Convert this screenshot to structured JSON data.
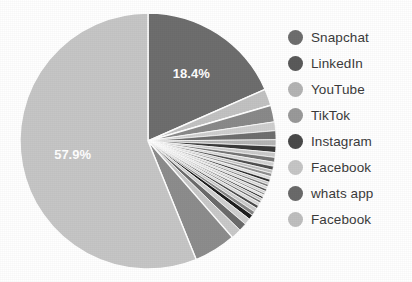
{
  "chart_data": {
    "type": "pie",
    "title": "",
    "xlabel": "",
    "ylabel": "",
    "legend_position": "right",
    "grid": false,
    "start_angle_deg": 90,
    "direction": "clockwise",
    "separator_color": "#ffffff",
    "visible_labels": [
      {
        "text": "18.4%",
        "value": 18.4
      },
      {
        "text": "57.9%",
        "value": 57.9
      }
    ],
    "categories": [
      "Snapchat",
      "LinkedIn",
      "YouTube",
      "TikTok",
      "Instagram",
      "Facebook",
      "whats app",
      "Facebook"
    ],
    "values": [
      18.4,
      2.6,
      7.9,
      1.3,
      1.3,
      57.9,
      5.3,
      5.3
    ],
    "colors": [
      "#6e6e6e",
      "#5a5a5a",
      "#b4b4b4",
      "#9a9a9a",
      "#4a4a4a",
      "#c6c6c6",
      "#6a6a6a",
      "#bfbfbf"
    ],
    "slices": [
      {
        "label": "18.4%",
        "value": 18.4,
        "color": "#6e6e6e",
        "start_deg": 0.0,
        "sweep_deg": 66.2
      },
      {
        "value": 2.1,
        "color": "#c2c2c2",
        "start_deg": 66.2,
        "sweep_deg": 7.6
      },
      {
        "value": 2.1,
        "color": "#8a8a8a",
        "start_deg": 73.8,
        "sweep_deg": 7.6
      },
      {
        "value": 1.1,
        "color": "#cfcfcf",
        "start_deg": 81.4,
        "sweep_deg": 4.0
      },
      {
        "value": 1.1,
        "color": "#6f6f6f",
        "start_deg": 85.4,
        "sweep_deg": 4.0
      },
      {
        "value": 0.8,
        "color": "#b5b5b5",
        "start_deg": 89.4,
        "sweep_deg": 2.9
      },
      {
        "value": 0.8,
        "color": "#3a3a3a",
        "start_deg": 92.3,
        "sweep_deg": 2.9
      },
      {
        "value": 0.6,
        "color": "#cacaca",
        "start_deg": 95.2,
        "sweep_deg": 2.2
      },
      {
        "value": 0.6,
        "color": "#767676",
        "start_deg": 97.4,
        "sweep_deg": 2.2
      },
      {
        "value": 0.5,
        "color": "#d2d2d2",
        "start_deg": 99.6,
        "sweep_deg": 1.8
      },
      {
        "value": 0.5,
        "color": "#4f4f4f",
        "start_deg": 101.4,
        "sweep_deg": 1.8
      },
      {
        "value": 0.4,
        "color": "#c0c0c0",
        "start_deg": 103.2,
        "sweep_deg": 1.5
      },
      {
        "value": 0.4,
        "color": "#8f8f8f",
        "start_deg": 104.7,
        "sweep_deg": 1.5
      },
      {
        "value": 0.35,
        "color": "#dcdcdc",
        "start_deg": 106.2,
        "sweep_deg": 1.3
      },
      {
        "value": 0.35,
        "color": "#2f2f2f",
        "start_deg": 107.5,
        "sweep_deg": 1.3
      },
      {
        "value": 0.3,
        "color": "#c8c8c8",
        "start_deg": 108.8,
        "sweep_deg": 1.1
      },
      {
        "value": 0.3,
        "color": "#7a7a7a",
        "start_deg": 109.9,
        "sweep_deg": 1.1
      },
      {
        "value": 0.3,
        "color": "#d6d6d6",
        "start_deg": 111.0,
        "sweep_deg": 1.1
      },
      {
        "value": 0.3,
        "color": "#565656",
        "start_deg": 112.1,
        "sweep_deg": 1.1
      },
      {
        "value": 0.25,
        "color": "#cdcdcd",
        "start_deg": 113.2,
        "sweep_deg": 0.9
      },
      {
        "value": 0.25,
        "color": "#8b8b8b",
        "start_deg": 114.1,
        "sweep_deg": 0.9
      },
      {
        "value": 0.25,
        "color": "#e0e0e0",
        "start_deg": 115.0,
        "sweep_deg": 0.9
      },
      {
        "value": 0.25,
        "color": "#222222",
        "start_deg": 115.9,
        "sweep_deg": 0.9
      },
      {
        "value": 0.3,
        "color": "#c4c4c4",
        "start_deg": 116.8,
        "sweep_deg": 1.1
      },
      {
        "value": 0.3,
        "color": "#707070",
        "start_deg": 117.9,
        "sweep_deg": 1.1
      },
      {
        "value": 0.4,
        "color": "#dadada",
        "start_deg": 119.0,
        "sweep_deg": 1.4
      },
      {
        "value": 0.4,
        "color": "#4b4b4b",
        "start_deg": 120.4,
        "sweep_deg": 1.4
      },
      {
        "value": 0.5,
        "color": "#cbcbcb",
        "start_deg": 121.8,
        "sweep_deg": 1.8
      },
      {
        "value": 0.5,
        "color": "#858585",
        "start_deg": 123.6,
        "sweep_deg": 1.8
      },
      {
        "value": 0.6,
        "color": "#1e1e1e",
        "start_deg": 125.4,
        "sweep_deg": 2.2
      },
      {
        "value": 0.8,
        "color": "#d0d0d0",
        "start_deg": 127.6,
        "sweep_deg": 2.9
      },
      {
        "value": 1.0,
        "color": "#6b6b6b",
        "start_deg": 130.5,
        "sweep_deg": 3.6
      },
      {
        "value": 1.3,
        "color": "#c9c9c9",
        "start_deg": 134.1,
        "sweep_deg": 4.7
      },
      {
        "value": 5.3,
        "color": "#8d8d8d",
        "start_deg": 138.8,
        "sweep_deg": 19.1
      },
      {
        "label": "57.9%",
        "value": 57.9,
        "color": "#c6c6c6",
        "start_deg": 157.9,
        "sweep_deg": 202.1
      }
    ]
  },
  "legend": {
    "items": [
      {
        "label": "Snapchat",
        "color": "#6e6e6e"
      },
      {
        "label": "LinkedIn",
        "color": "#5a5a5a"
      },
      {
        "label": "YouTube",
        "color": "#b4b4b4"
      },
      {
        "label": "TikTok",
        "color": "#9a9a9a"
      },
      {
        "label": "Instagram",
        "color": "#4a4a4a"
      },
      {
        "label": "Facebook",
        "color": "#c6c6c6"
      },
      {
        "label": "whats app",
        "color": "#6a6a6a"
      },
      {
        "label": "Facebook",
        "color": "#bfbfbf"
      }
    ]
  }
}
